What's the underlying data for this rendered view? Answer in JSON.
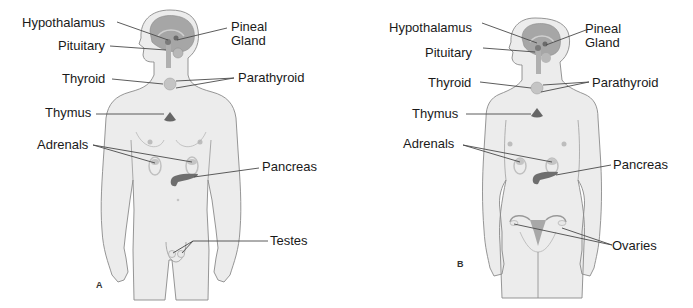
{
  "figure": {
    "colors": {
      "skin": "#ececec",
      "outline": "#8a8a8a",
      "brain": "#9a9a9a",
      "organ": "#6e6e6e",
      "organ_light": "#c8c8c8",
      "leader": "#4a4a4a",
      "text": "#1a1a1a"
    },
    "panels": [
      {
        "letter": "A",
        "subject": "male",
        "labels": {
          "hypothalamus": "Hypothalamus",
          "pineal": "Pineal\nGland",
          "pineal_l1": "Pineal",
          "pineal_l2": "Gland",
          "pituitary": "Pituitary",
          "thyroid": "Thyroid",
          "parathyroid": "Parathyroid",
          "thymus": "Thymus",
          "adrenals": "Adrenals",
          "pancreas": "Pancreas",
          "gonads": "Testes"
        }
      },
      {
        "letter": "B",
        "subject": "female",
        "labels": {
          "hypothalamus": "Hypothalamus",
          "pineal_l1": "Pineal",
          "pineal_l2": "Gland",
          "pituitary": "Pituitary",
          "thyroid": "Thyroid",
          "parathyroid": "Parathyroid",
          "thymus": "Thymus",
          "adrenals": "Adrenals",
          "pancreas": "Pancreas",
          "gonads": "Ovaries"
        }
      }
    ]
  }
}
